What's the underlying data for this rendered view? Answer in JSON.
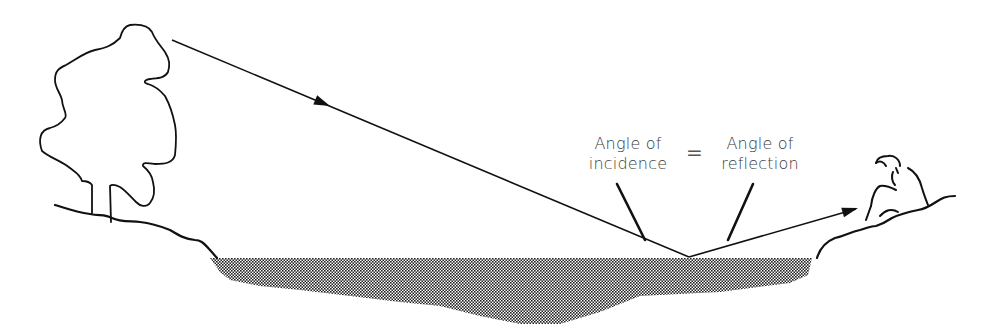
{
  "diagram": {
    "type": "reflection-of-light",
    "labels": {
      "incidence_line1": "Angle of",
      "incidence_line2": "incidence",
      "equals": "=",
      "reflection_line1": "Angle of",
      "reflection_line2": "reflection"
    },
    "elements": {
      "tree": "tree-outline",
      "observer": "seated-person",
      "water": "pond",
      "incident_ray": "arrow-ray",
      "reflected_ray": "arrow-ray"
    },
    "colors": {
      "line": "#111111",
      "water_fill": "#6e6e6e",
      "text": "#3a3a3a"
    }
  }
}
